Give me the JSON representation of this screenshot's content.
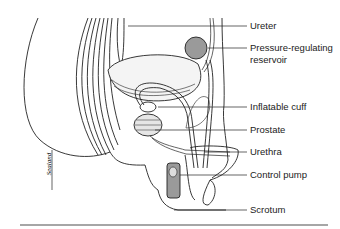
{
  "diagram": {
    "labels": [
      {
        "id": "ureter",
        "text": "Ureter",
        "y": 22
      },
      {
        "id": "reservoir",
        "text": "Pressure-regulating",
        "text2": "reservoir",
        "y": 43
      },
      {
        "id": "cuff",
        "text": "Inflatable cuff",
        "y": 102
      },
      {
        "id": "prostate",
        "text": "Prostate",
        "y": 125
      },
      {
        "id": "urethra",
        "text": "Urethra",
        "y": 148
      },
      {
        "id": "pump",
        "text": "Control pump",
        "y": 171
      },
      {
        "id": "scrotum",
        "text": "Scrotum",
        "y": 205
      }
    ],
    "signature": "Sealand",
    "colors": {
      "device": "#9a9a9a",
      "line": "#222222",
      "rule": "#888888"
    }
  }
}
